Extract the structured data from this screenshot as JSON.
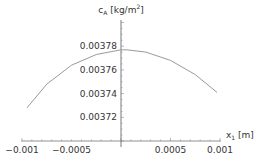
{
  "chart_data": {
    "type": "line",
    "title": "",
    "xlabel": "x1 [m]",
    "ylabel": "cA [kg/m2]",
    "xlabel_parts": {
      "base": "x",
      "sub": "1",
      "unit": " [m]"
    },
    "ylabel_parts": {
      "base": "c",
      "sub": "A",
      "unit_pre": " [kg/m",
      "sup": "2",
      "unit_post": "]"
    },
    "xlim": [
      -0.001,
      0.001
    ],
    "ylim": [
      0.0037,
      0.0038
    ],
    "x_ticks": [
      -0.001,
      -0.0005,
      0.0005,
      0.001
    ],
    "x_tick_labels": [
      "-0.001",
      "-0.0005",
      "0.0005",
      "0.001"
    ],
    "y_ticks": [
      0.00372,
      0.00374,
      0.00376,
      0.00378
    ],
    "y_tick_labels": [
      "0.00372",
      "0.00374",
      "0.00376",
      "0.00378"
    ],
    "grid": false,
    "legend": null,
    "series": [
      {
        "name": "cA(x1)",
        "color": "#9a9a9a",
        "x": [
          -0.00095,
          -0.00075,
          -0.0005,
          -0.00025,
          0.0,
          6e-05,
          0.00025,
          0.0005,
          0.00075,
          0.00097
        ],
        "values": [
          0.003728,
          0.003748,
          0.003764,
          0.003773,
          0.003777,
          0.003777,
          0.003775,
          0.003768,
          0.003756,
          0.003741
        ]
      }
    ]
  }
}
